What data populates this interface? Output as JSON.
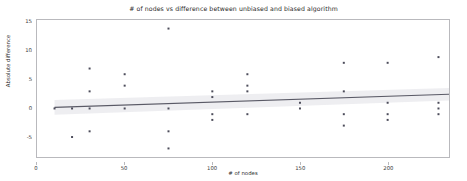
{
  "chart_data": {
    "type": "scatter",
    "title": "# of nodes vs difference between unbiased and biased algorithm",
    "xlabel": "# of nodes",
    "ylabel": "Absolute difference",
    "xlim": [
      0,
      235
    ],
    "ylim": [
      -8.5,
      15.5
    ],
    "xticks": [
      0,
      50,
      100,
      150,
      200
    ],
    "xticklabels": [
      "0",
      "50",
      "100",
      "150",
      "200"
    ],
    "yticks": [
      -5,
      0,
      5,
      10,
      15
    ],
    "yticklabels": [
      "-5",
      "0",
      "5",
      "10",
      "15"
    ],
    "grid": false,
    "legend": null,
    "marker_color": "#4c4c5a",
    "line_color": "#5a5a66",
    "band_color": "#e8e8ec",
    "points": [
      {
        "x": 10,
        "y": 0
      },
      {
        "x": 20,
        "y": 0
      },
      {
        "x": 20,
        "y": -5
      },
      {
        "x": 30,
        "y": 7
      },
      {
        "x": 30,
        "y": 3
      },
      {
        "x": 30,
        "y": 0
      },
      {
        "x": 30,
        "y": -4
      },
      {
        "x": 50,
        "y": 6
      },
      {
        "x": 50,
        "y": 4
      },
      {
        "x": 50,
        "y": 0
      },
      {
        "x": 75,
        "y": 14
      },
      {
        "x": 75,
        "y": 0
      },
      {
        "x": 75,
        "y": -4
      },
      {
        "x": 75,
        "y": -7
      },
      {
        "x": 100,
        "y": 3
      },
      {
        "x": 100,
        "y": 2
      },
      {
        "x": 100,
        "y": -1
      },
      {
        "x": 100,
        "y": -2
      },
      {
        "x": 120,
        "y": 6
      },
      {
        "x": 120,
        "y": 4
      },
      {
        "x": 120,
        "y": 3
      },
      {
        "x": 120,
        "y": -1
      },
      {
        "x": 150,
        "y": 1
      },
      {
        "x": 150,
        "y": 0
      },
      {
        "x": 175,
        "y": 8
      },
      {
        "x": 175,
        "y": 3
      },
      {
        "x": 175,
        "y": -1
      },
      {
        "x": 175,
        "y": -3
      },
      {
        "x": 200,
        "y": 8
      },
      {
        "x": 200,
        "y": 1
      },
      {
        "x": 200,
        "y": -1
      },
      {
        "x": 200,
        "y": -2
      },
      {
        "x": 229,
        "y": 9
      },
      {
        "x": 229,
        "y": 1
      },
      {
        "x": 229,
        "y": 0
      },
      {
        "x": 229,
        "y": -1
      }
    ],
    "regression_line": {
      "x_start": 10,
      "y_start": 0.2,
      "x_end": 235,
      "y_end": 2.5
    },
    "confidence_band": {
      "x_start": 10,
      "upper_start": 1.5,
      "lower_start": -1.1,
      "x_end": 235,
      "upper_end": 3.6,
      "lower_end": 1.4
    }
  }
}
